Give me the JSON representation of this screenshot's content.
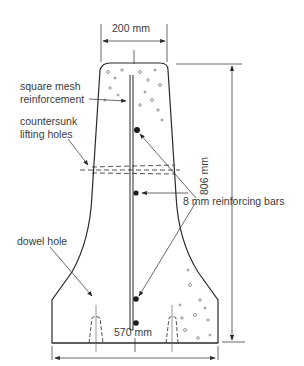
{
  "diagram": {
    "dimensions": {
      "top_width": "200 mm",
      "height": "806 mm",
      "base_width": "570 mm"
    },
    "labels": {
      "mesh_line1": "square mesh",
      "mesh_line2": "reinforcement",
      "lifting_line1": "countersunk",
      "lifting_line2": "lifting holes",
      "bars": "8 mm reinforcing bars",
      "dowel": "dowel hole"
    },
    "colors": {
      "ink": "#2a2a2a",
      "background": "#ffffff"
    }
  }
}
